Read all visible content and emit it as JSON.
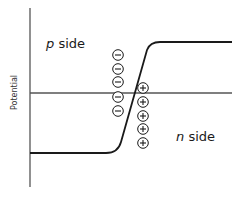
{
  "diagram": {
    "type": "pn-junction-potential",
    "y_axis_label": "Potential",
    "regions": {
      "p_side": {
        "var": "p",
        "text": "side"
      },
      "n_side": {
        "var": "n",
        "text": "side"
      }
    },
    "charges": {
      "negative": {
        "symbol": "−",
        "count": 5,
        "x": 118,
        "y": [
          55,
          69,
          82,
          97,
          111
        ]
      },
      "positive": {
        "symbol": "+",
        "count": 5,
        "x": 143,
        "y": [
          88,
          102,
          116,
          129,
          143
        ]
      }
    },
    "curve": {
      "low_level_y": 153,
      "high_level_y": 42,
      "reference_line_y": 93
    },
    "colors": {
      "line": "#1a1a1a",
      "axis": "#555555",
      "text": "#1a1a1a"
    }
  }
}
